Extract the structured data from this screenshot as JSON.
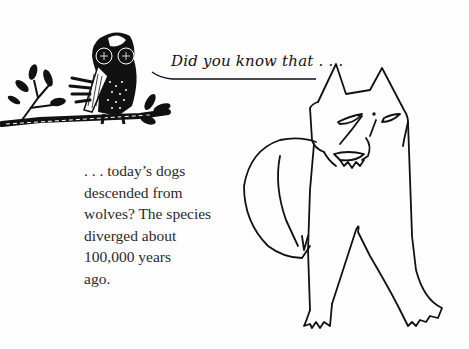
{
  "illustration": {
    "caption": "Did you know that . . .",
    "fact_lines": [
      ". . . today’s dogs",
      "descended from",
      "wolves? The species",
      "diverged about",
      "100,000 years",
      "ago."
    ],
    "figures": [
      "owl-on-branch",
      "wolf"
    ],
    "colors": {
      "ink": "#111111",
      "text": "#2a2a2a",
      "background": "#fefefe"
    }
  }
}
